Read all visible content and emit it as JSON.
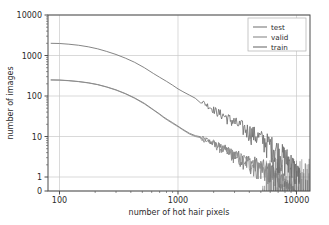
{
  "chart_data": {
    "type": "line",
    "title": "",
    "xlabel": "number of hot hair pixels",
    "ylabel": "number of images",
    "xscale": "log",
    "yscale": "symlog",
    "xlim": [
      80,
      13000
    ],
    "ylim": [
      0,
      10000
    ],
    "xticks": [
      100,
      1000,
      10000
    ],
    "xticklabels": [
      "100",
      "1000",
      "10000"
    ],
    "yticks": [
      0,
      1,
      10,
      100,
      1000,
      10000
    ],
    "yticklabels": [
      "0",
      "1",
      "10",
      "100",
      "1000",
      "10000"
    ],
    "grid": true,
    "legend_position": "upper right",
    "series": [
      {
        "name": "test",
        "color": "#7a7a7a",
        "x": [
          85,
          100,
          120,
          145,
          175,
          210,
          250,
          300,
          360,
          430,
          520,
          620,
          700,
          760,
          820,
          900,
          1000,
          1100,
          1250,
          1400,
          1550,
          1700,
          1850,
          2000,
          2150,
          2300,
          2500,
          2700,
          2900,
          3100,
          3400,
          3700,
          4000,
          4300,
          4600,
          5000,
          5400,
          5800,
          6200,
          6600,
          7000,
          7400,
          7800,
          8200,
          8600,
          9000,
          9400,
          9800
        ],
        "y": [
          250,
          248,
          240,
          228,
          212,
          192,
          168,
          142,
          115,
          90,
          66,
          46,
          36,
          30,
          26,
          22,
          18,
          15,
          12,
          10.5,
          9.5,
          8.5,
          7.5,
          7.0,
          6.0,
          5.5,
          4.8,
          4.2,
          3.8,
          3.4,
          3.0,
          2.6,
          2.4,
          2.2,
          2.0,
          1.8,
          1.6,
          1.4,
          1.3,
          1.2,
          1.0,
          0.9,
          0.7,
          0.5,
          0.4,
          0.3,
          0.2,
          0.0
        ]
      },
      {
        "name": "valid",
        "color": "#8a8a8a",
        "x": [
          85,
          100,
          120,
          145,
          175,
          210,
          250,
          300,
          360,
          430,
          520,
          620,
          700,
          760,
          820,
          900,
          1000,
          1100,
          1250,
          1400,
          1550,
          1700,
          1850,
          2000,
          2150,
          2300,
          2500,
          2700,
          2900,
          3100,
          3400,
          3700,
          4000,
          4300,
          4600,
          5000,
          5400,
          5800,
          6200,
          6600,
          7000,
          7400,
          7800,
          8200,
          8600,
          9000,
          9400,
          9800
        ],
        "y": [
          248,
          246,
          238,
          226,
          210,
          190,
          166,
          140,
          113,
          88,
          64,
          45,
          35,
          29,
          25,
          21,
          17.5,
          14.5,
          11.5,
          10.0,
          9.0,
          8.0,
          7.2,
          6.5,
          5.8,
          5.0,
          4.5,
          4.0,
          3.5,
          3.2,
          2.8,
          2.5,
          2.2,
          2.0,
          1.8,
          1.6,
          1.4,
          1.2,
          1.1,
          1.0,
          0.9,
          0.7,
          0.6,
          0.4,
          0.3,
          0.2,
          0.1,
          0.0
        ]
      },
      {
        "name": "train",
        "color": "#6f6f6f",
        "x": [
          85,
          100,
          120,
          145,
          175,
          210,
          250,
          300,
          360,
          430,
          520,
          620,
          700,
          800,
          900,
          1000,
          1100,
          1250,
          1400,
          1550,
          1700,
          1850,
          2000,
          2150,
          2300,
          2500,
          2700,
          2900,
          3100,
          3400,
          3700,
          4000,
          4300,
          4600,
          5000,
          5400,
          5800,
          6200,
          6600,
          7000,
          7400,
          7800,
          8200,
          8600,
          9000,
          9400,
          9800,
          10500
        ],
        "y": [
          2000,
          1980,
          1900,
          1790,
          1640,
          1460,
          1260,
          1060,
          860,
          680,
          500,
          360,
          290,
          230,
          185,
          150,
          128,
          105,
          88,
          76,
          64,
          54,
          46,
          40,
          36,
          31,
          27,
          24,
          21,
          18,
          15.5,
          13.5,
          12.0,
          10.5,
          9.0,
          8.0,
          7.0,
          6.0,
          5.2,
          4.5,
          4.0,
          3.4,
          3.0,
          2.6,
          2.2,
          1.8,
          1.4,
          1.0
        ]
      }
    ],
    "legend_entries": [
      "test",
      "valid",
      "train"
    ]
  },
  "style": {
    "axis_color": "#4d4d4d",
    "grid_color": "#c8c8c8",
    "text_color": "#2b2b2b",
    "background": "#ffffff"
  }
}
